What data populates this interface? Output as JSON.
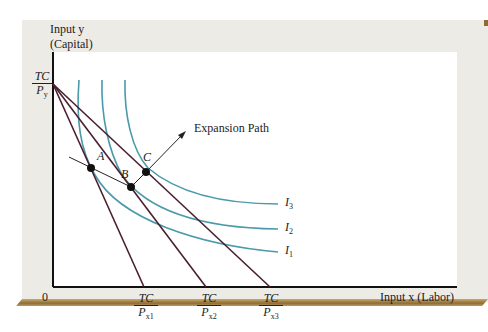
{
  "figure": {
    "y_axis_label_line1": "Input y",
    "y_axis_label_line2": "(Capital)",
    "x_axis_label": "Input x (Labor)",
    "origin_label": "0",
    "y_intercept": {
      "num": "TC",
      "den": "P",
      "sub": "y"
    },
    "x_intercepts": [
      {
        "num": "TC",
        "den": "P",
        "sub": "x1"
      },
      {
        "num": "TC",
        "den": "P",
        "sub": "x2"
      },
      {
        "num": "TC",
        "den": "P",
        "sub": "x3"
      }
    ],
    "points": [
      {
        "label": "A"
      },
      {
        "label": "B"
      },
      {
        "label": "C"
      }
    ],
    "expansion_path_label": "Expansion Path",
    "isoquants": [
      {
        "label": "I",
        "sub": "3"
      },
      {
        "label": "I",
        "sub": "2"
      },
      {
        "label": "I",
        "sub": "1"
      }
    ],
    "colors": {
      "isoquant": "#4a9aaa",
      "budget_line": "#4a2030",
      "point": "#111111",
      "panel": "#ecebe6",
      "shadow": "#8f6c35"
    }
  }
}
